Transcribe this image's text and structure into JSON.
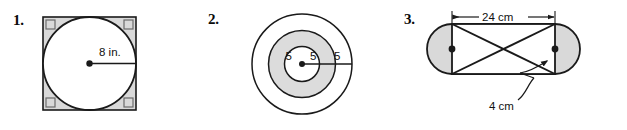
{
  "page": {
    "background_color": "#ffffff"
  },
  "style": {
    "shade_color": "#d9d9d9",
    "shade_color_light": "#dcdcdc",
    "stroke_color": "#1a1a1a",
    "white_fill": "#ffffff",
    "text_color": "#111111"
  },
  "figures": [
    {
      "number": "1.",
      "shape": "circle-inscribed-in-square",
      "labels": {
        "radius": "8 in."
      },
      "annotations": {
        "right_angle_marks": 4,
        "center_dot": true,
        "shaded_region": "square-corners"
      }
    },
    {
      "number": "2.",
      "shape": "three-concentric-circles",
      "labels": {
        "inner": "5",
        "middle": "5",
        "outer": "5"
      },
      "annotations": {
        "center_dot": true,
        "shaded_region": "middle-annulus"
      }
    },
    {
      "number": "3.",
      "shape": "stadium-with-inscribed-rectangle-and-diagonals",
      "labels": {
        "width": "24 cm",
        "height": "4 cm"
      },
      "annotations": {
        "center_dots": 2,
        "shaded_region": "semicircular-ends",
        "leader_line": true
      }
    }
  ]
}
